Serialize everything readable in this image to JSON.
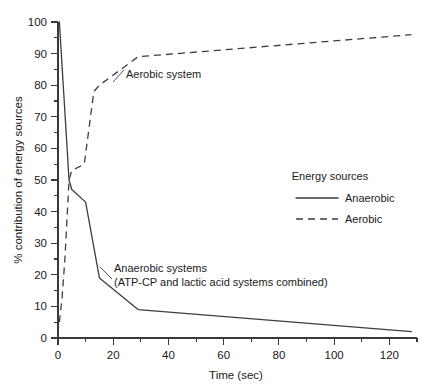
{
  "chart_data": {
    "type": "line",
    "title": "",
    "xlabel": "Time (sec)",
    "ylabel": "% contribution of energy sources",
    "xlim": [
      0,
      130
    ],
    "ylim": [
      0,
      100
    ],
    "grid": false,
    "legend_position": "right-middle",
    "legend_title": "Energy sources",
    "x_ticks_major": [
      0,
      20,
      40,
      60,
      80,
      100,
      120
    ],
    "x_ticks_minor": [
      10,
      30,
      50,
      70,
      90,
      110,
      130
    ],
    "x_tick_labels": [
      "0",
      "20",
      "40",
      "60",
      "80",
      "100",
      "120"
    ],
    "y_ticks_major": [
      0,
      10,
      20,
      30,
      40,
      50,
      60,
      70,
      80,
      90,
      100
    ],
    "y_ticks_minor": [
      5,
      15,
      25,
      35,
      45,
      55,
      65,
      75,
      85,
      95
    ],
    "y_tick_labels": [
      "0",
      "10",
      "20",
      "30",
      "40",
      "50",
      "60",
      "70",
      "80",
      "90",
      "100"
    ],
    "series": [
      {
        "name": "Anaerobic",
        "style": "solid",
        "color": "#3d3d3d",
        "points": [
          [
            0.5,
            100
          ],
          [
            4.0,
            50
          ],
          [
            5.0,
            47
          ],
          [
            10.0,
            43
          ],
          [
            15.0,
            19
          ],
          [
            29.0,
            9
          ],
          [
            128.0,
            2
          ]
        ]
      },
      {
        "name": "Aerobic",
        "style": "dashed",
        "color": "#3d3d3d",
        "points": [
          [
            0.5,
            5
          ],
          [
            1.5,
            13
          ],
          [
            2.5,
            25
          ],
          [
            4.0,
            50
          ],
          [
            5.0,
            53
          ],
          [
            9.5,
            55
          ],
          [
            13.0,
            78
          ],
          [
            15.0,
            80
          ],
          [
            29.0,
            89
          ],
          [
            128.0,
            96
          ]
        ]
      }
    ],
    "annotations": [
      {
        "id": "aerobic-annotation",
        "text": "Aerobic system",
        "x": 17,
        "y": 76
      },
      {
        "id": "anaerobic-annotation-line1",
        "text": "Anaerobic systems",
        "x": 19,
        "y": 21
      },
      {
        "id": "anaerobic-annotation-line2",
        "text": "(ATP-CP and lactic acid systems combined)",
        "x": 19,
        "y": 16
      }
    ]
  },
  "legend": {
    "title": "Energy sources",
    "entries": [
      {
        "label": "Anaerobic",
        "style": "solid"
      },
      {
        "label": "Aerobic",
        "style": "dashed"
      }
    ]
  },
  "axes": {
    "x_title": "Time (sec)",
    "y_title": "% contribution of energy sources"
  }
}
